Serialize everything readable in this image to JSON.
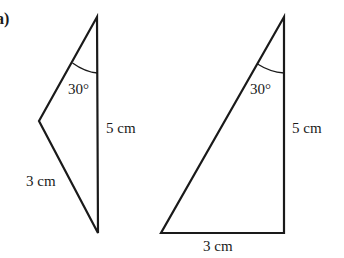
{
  "part_label": "a)",
  "triangles": [
    {
      "id": "left",
      "vertices": [
        [
          97,
          17
        ],
        [
          39,
          121
        ],
        [
          98,
          233
        ]
      ],
      "angle_label": "30°",
      "side_labels": {
        "vertical": "5 cm",
        "lower_left": "3 cm"
      }
    },
    {
      "id": "right",
      "vertices": [
        [
          284,
          17
        ],
        [
          161,
          233
        ],
        [
          284,
          233
        ]
      ],
      "angle_label": "30°",
      "side_labels": {
        "vertical": "5 cm",
        "bottom": "3 cm"
      }
    }
  ],
  "colors": {
    "stroke": "#1a1a1a",
    "background": "#ffffff"
  }
}
